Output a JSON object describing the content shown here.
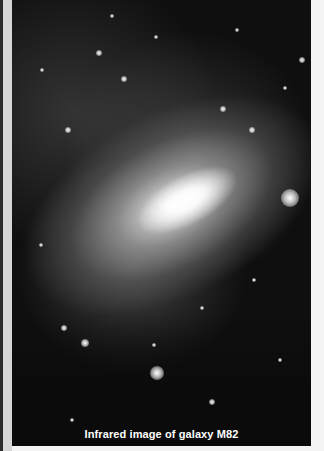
{
  "image": {
    "subject": "galaxy-m82",
    "caption": "Infrared image of galaxy M82",
    "stars": [
      {
        "x": 278,
        "y": 198,
        "r": 9
      },
      {
        "x": 145,
        "y": 373,
        "r": 7
      },
      {
        "x": 112,
        "y": 79,
        "r": 3
      },
      {
        "x": 87,
        "y": 53,
        "r": 3
      },
      {
        "x": 144,
        "y": 37,
        "r": 2
      },
      {
        "x": 211,
        "y": 109,
        "r": 3
      },
      {
        "x": 290,
        "y": 60,
        "r": 3
      },
      {
        "x": 273,
        "y": 88,
        "r": 2
      },
      {
        "x": 56,
        "y": 130,
        "r": 3
      },
      {
        "x": 240,
        "y": 130,
        "r": 3
      },
      {
        "x": 29,
        "y": 245,
        "r": 2
      },
      {
        "x": 52,
        "y": 328,
        "r": 3
      },
      {
        "x": 73,
        "y": 343,
        "r": 4
      },
      {
        "x": 142,
        "y": 345,
        "r": 2
      },
      {
        "x": 190,
        "y": 308,
        "r": 2
      },
      {
        "x": 242,
        "y": 280,
        "r": 2
      },
      {
        "x": 200,
        "y": 402,
        "r": 3
      },
      {
        "x": 60,
        "y": 420,
        "r": 2
      },
      {
        "x": 268,
        "y": 360,
        "r": 2
      },
      {
        "x": 100,
        "y": 16,
        "r": 2
      },
      {
        "x": 225,
        "y": 30,
        "r": 2
      },
      {
        "x": 30,
        "y": 70,
        "r": 2
      }
    ]
  }
}
